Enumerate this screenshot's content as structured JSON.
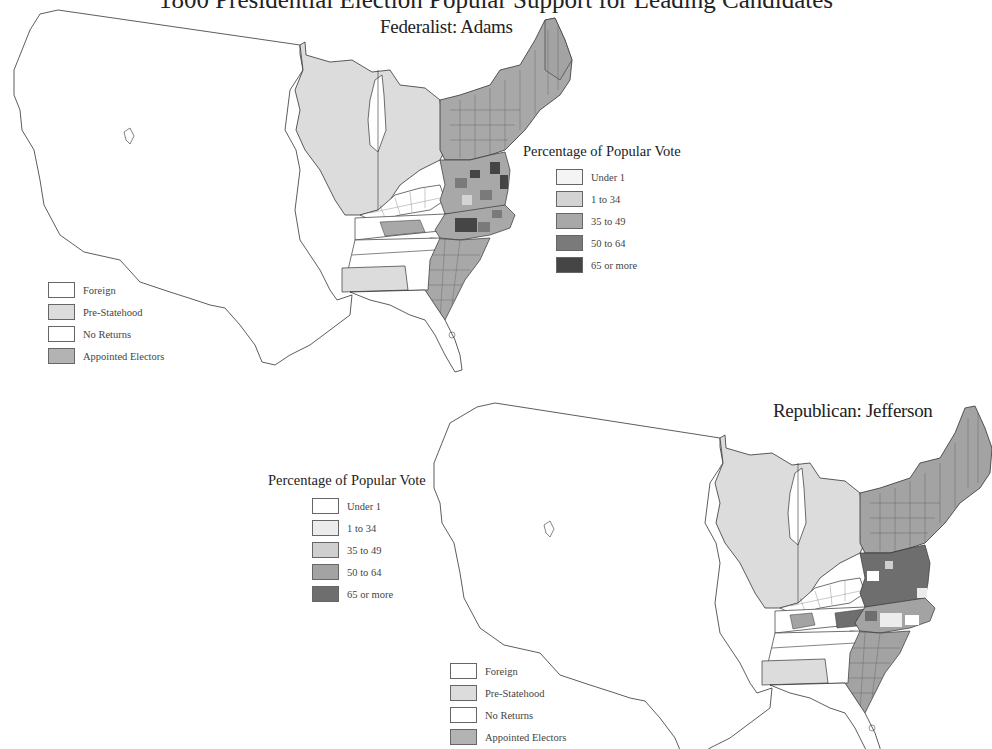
{
  "page": {
    "title": "1800 Presidential Election Popular Support for Leading Candidates"
  },
  "maps": [
    {
      "title": "Federalist: Adams",
      "party": "Federalist",
      "candidate": "Adams"
    },
    {
      "title": "Republican: Jefferson",
      "party": "Republican",
      "candidate": "Jefferson"
    }
  ],
  "vote_legend": {
    "title": "Percentage of Popular Vote",
    "items": [
      {
        "label": "Under 1",
        "color": "#f4f4f4"
      },
      {
        "label": "1 to 34",
        "color": "#d3d3d3"
      },
      {
        "label": "35 to 49",
        "color": "#a8a8a8"
      },
      {
        "label": "50 to 64",
        "color": "#7a7a7a"
      },
      {
        "label": "65 or more",
        "color": "#454545"
      }
    ]
  },
  "vote_legend_jefferson": {
    "title": "Percentage of Popular Vote",
    "items": [
      {
        "label": "Under 1",
        "color": "#ffffff"
      },
      {
        "label": "1 to 34",
        "color": "#ececec"
      },
      {
        "label": "35 to 49",
        "color": "#cfcfcf"
      },
      {
        "label": "50 to 64",
        "color": "#a3a3a3"
      },
      {
        "label": "65 or more",
        "color": "#6e6e6e"
      }
    ]
  },
  "status_legend": {
    "items": [
      {
        "label": "Foreign",
        "color": "#ffffff"
      },
      {
        "label": "Pre-Statehood",
        "color": "#dcdcdc"
      },
      {
        "label": "No Returns",
        "color": "#ffffff"
      },
      {
        "label": "Appointed Electors",
        "color": "#b3b3b3"
      }
    ]
  },
  "colors": {
    "outline": "#333333",
    "pre_statehood": "#dcdcdc",
    "appointed": "#b3b3b3",
    "no_returns": "#ffffff"
  }
}
